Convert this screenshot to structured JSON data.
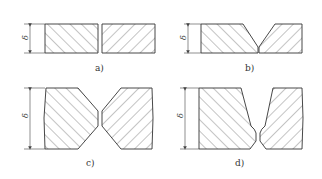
{
  "figure": {
    "type": "weld-joint-groove-types",
    "panels": [
      {
        "id": "a",
        "label": "a)",
        "groove": "square (I) butt",
        "dimension_symbol": "δ"
      },
      {
        "id": "b",
        "label": "b)",
        "groove": "single V",
        "dimension_symbol": "δ"
      },
      {
        "id": "c",
        "label": "c)",
        "groove": "double V (X)",
        "dimension_symbol": "δ"
      },
      {
        "id": "d",
        "label": "d)",
        "groove": "U-groove",
        "dimension_symbol": "δ"
      }
    ]
  },
  "colors": {
    "line": "#333333",
    "background": "#ffffff"
  }
}
